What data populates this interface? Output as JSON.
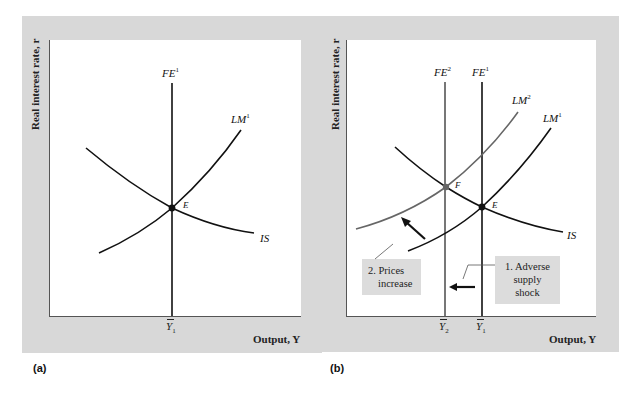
{
  "panels": [
    {
      "tag": "(a)",
      "y_axis_label": "Real interest rate, r",
      "x_axis_label": "Output, Y",
      "curves": [
        {
          "name": "FE",
          "sup": "1",
          "color": "#111111"
        },
        {
          "name": "LM",
          "sup": "1",
          "color": "#111111"
        },
        {
          "name": "IS",
          "sup": "",
          "color": "#111111"
        }
      ],
      "points": [
        {
          "label": "E"
        }
      ],
      "ticks": [
        {
          "base": "Y",
          "sub": "1"
        }
      ]
    },
    {
      "tag": "(b)",
      "y_axis_label": "Real interest rate, r",
      "x_axis_label": "Output, Y",
      "curves": [
        {
          "name": "FE",
          "sup": "2",
          "color": "#555555"
        },
        {
          "name": "FE",
          "sup": "1",
          "color": "#111111"
        },
        {
          "name": "LM",
          "sup": "2",
          "color": "#666666"
        },
        {
          "name": "LM",
          "sup": "1",
          "color": "#111111"
        },
        {
          "name": "IS",
          "sup": "",
          "color": "#111111"
        }
      ],
      "points": [
        {
          "label": "F"
        },
        {
          "label": "E"
        }
      ],
      "ticks": [
        {
          "base": "Y",
          "sub": "2"
        },
        {
          "base": "Y",
          "sub": "1"
        }
      ],
      "annotations": [
        {
          "line1": "2. Prices",
          "line2": "increase"
        },
        {
          "line1": "1. Adverse",
          "line2": "supply",
          "line3": "shock"
        }
      ]
    }
  ],
  "colors": {
    "panel_bg": "#d8d8d8",
    "plot_bg": "#ffffff",
    "curve": "#111111",
    "shifted_curve": "#666666",
    "note_bg": "#dcdcdc"
  }
}
